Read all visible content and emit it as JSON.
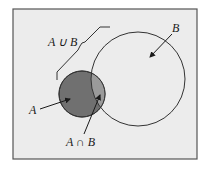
{
  "diagram": {
    "type": "venn",
    "background_color": "#ececec",
    "frame_color": "#555555",
    "sets": [
      {
        "name": "A",
        "label": "A",
        "fill": "#707070"
      },
      {
        "name": "B",
        "label": "B",
        "fill": "none"
      }
    ],
    "labels": {
      "union": "A ∪ B",
      "intersection": "A ∩ B",
      "set_a": "A",
      "set_b": "B"
    },
    "intersection_fill": "#9a9a9a"
  }
}
